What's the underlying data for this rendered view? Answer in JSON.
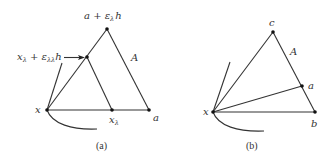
{
  "figure_a": {
    "caption": "(a)",
    "points": {
      "x": "x",
      "x_lambda": "x",
      "x_lambda_sub": "λ",
      "a": "a",
      "apex_main": "a + ε",
      "apex_sub": "λ",
      "apex_tail": "h",
      "inner_main": "x",
      "inner_sub": "λ",
      "inner_mid": " + ε",
      "inner_sub2": "λλ",
      "inner_tail": "h"
    },
    "set_label": "A"
  },
  "figure_b": {
    "caption": "(b)",
    "points": {
      "x": "x",
      "a": "a",
      "b": "b",
      "c": "c"
    },
    "set_label": "A"
  },
  "colors": {
    "line": "#333333",
    "dot": "#111111",
    "background": "#ffffff"
  }
}
